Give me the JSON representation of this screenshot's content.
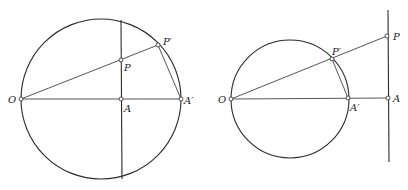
{
  "figures": [
    {
      "id": "left",
      "labels": {
        "O": "O",
        "P": "P",
        "P_prime": "P′",
        "A": "A",
        "A_prime": "A′"
      }
    },
    {
      "id": "right",
      "labels": {
        "O": "O",
        "P": "P",
        "P_prime": "P′",
        "A": "A",
        "A_prime": "A′"
      }
    }
  ]
}
